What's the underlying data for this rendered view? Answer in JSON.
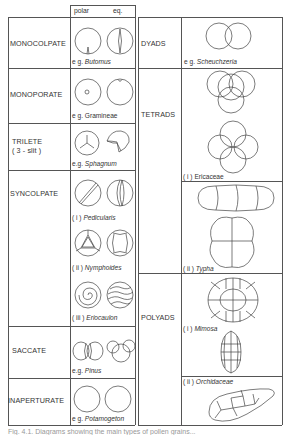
{
  "header": {
    "polar": "polar",
    "eq": "eq."
  },
  "left_table": {
    "rows": [
      {
        "type": "MONOCOLPATE",
        "example_prefix": "e g.",
        "example": "Butomus",
        "italic": true
      },
      {
        "type": "MONOPORATE",
        "example_prefix": "e g.",
        "example": "Gramineae",
        "italic": false
      },
      {
        "type": "TRILETE",
        "type_sub": "( 3 - slit )",
        "example_prefix": "e.g.",
        "example": "Sphagnum",
        "italic": true
      },
      {
        "type": "SYNCOLPATE",
        "examples": [
          {
            "prefix": "( i )",
            "name": "Pedicularis"
          },
          {
            "prefix": "( ii )",
            "name": "Nymphoides"
          },
          {
            "prefix": "( iii )",
            "name": "Eriocaulon"
          }
        ]
      },
      {
        "type": "SACCATE",
        "example_prefix": "e.g.",
        "example": "Pinus",
        "italic": true
      },
      {
        "type": "INAPERTURATE",
        "example_prefix": "e g.",
        "example": "Potamogeton",
        "italic": true
      }
    ]
  },
  "right_table": {
    "rows": [
      {
        "type": "DYADS",
        "example_prefix": "e g.",
        "example": "Scheuchzeria"
      },
      {
        "type": "TETRADS",
        "examples": [
          {
            "prefix": "( i )",
            "name": "Ericaceae",
            "italic": false
          },
          {
            "prefix": "( ii )",
            "name": "Typha",
            "italic": true
          }
        ]
      },
      {
        "type": "POLYADS",
        "examples": [
          {
            "prefix": "( i )",
            "name": "Mimosa",
            "italic": true
          },
          {
            "prefix": "( ii )",
            "name": "Orchidaceae",
            "italic": true
          }
        ]
      }
    ]
  },
  "caption": "Fig. 4.1. Diagrams showing the main types of pollen grains..."
}
